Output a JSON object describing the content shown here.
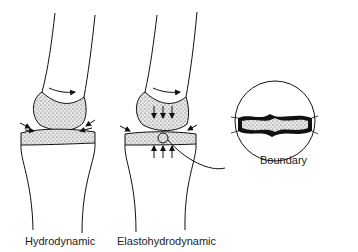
{
  "diagram": {
    "panels": [
      {
        "id": "hydrodynamic",
        "label": "Hydrodynamic"
      },
      {
        "id": "elastohydrodynamic",
        "label": "Elastohydrodynamic"
      }
    ],
    "inset": {
      "label": "Boundary"
    }
  }
}
